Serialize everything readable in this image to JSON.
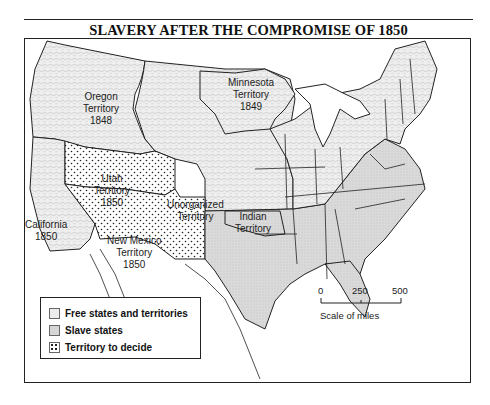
{
  "map": {
    "title": "SLAVERY AFTER THE COMPROMISE OF 1850",
    "colors": {
      "free": "#ececec",
      "slave": "#d6d6d6",
      "undecided": "#ffffff",
      "border": "#222222"
    },
    "regions": {
      "oregon": {
        "line1": "Oregon",
        "line2": "Territory",
        "line3": "1848"
      },
      "minnesota": {
        "line1": "Minnesota",
        "line2": "Territory",
        "line3": "1849"
      },
      "utah": {
        "line1": "Utah",
        "line2": "Territory",
        "line3": "1850"
      },
      "unorganized": {
        "line1": "Unorganized",
        "line2": "Territory"
      },
      "california": {
        "line1": "California",
        "line2": "1850"
      },
      "new_mexico": {
        "line1": "New Mexico",
        "line2": "Territory",
        "line3": "1850"
      },
      "indian": {
        "line1": "Indian",
        "line2": "Territory"
      }
    },
    "legend": [
      {
        "label": "Free states and territories",
        "pattern": "free"
      },
      {
        "label": "Slave states",
        "pattern": "slave"
      },
      {
        "label": "Territory to decide",
        "pattern": "undecided"
      }
    ],
    "scale": {
      "ticks": [
        "0",
        "250",
        "500"
      ],
      "label": "Scale of miles"
    }
  }
}
